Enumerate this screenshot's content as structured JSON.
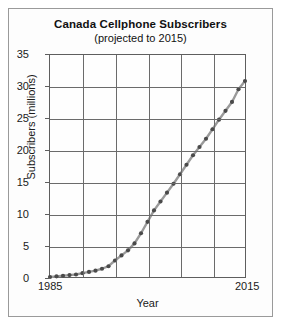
{
  "chart": {
    "title": "Canada Cellphone Subscribers",
    "subtitle": "(projected to 2015)"
  },
  "axis": {
    "x_title": "Year",
    "y_title": "Subscribers (millions)",
    "x_tick_labels": [
      "1985",
      "2015"
    ],
    "y_tick_labels": [
      "35",
      "30",
      "25",
      "20",
      "15",
      "10",
      "5",
      "0"
    ]
  },
  "style": {
    "line_color": "#9a9a9a",
    "marker_color": "#4a4a4a",
    "grid_color": "#6b6b6b",
    "axis_color": "#5e5e5e",
    "text_color": "#1a1a1a",
    "frame_color": "#9a9a9a",
    "background": "#fdfdfd"
  },
  "chart_data": {
    "type": "line",
    "title": "Canada Cellphone Subscribers (projected to 2015)",
    "xlabel": "Year",
    "ylabel": "Subscribers (millions)",
    "xlim": [
      1985,
      2015
    ],
    "ylim": [
      0,
      35
    ],
    "xticks": [
      1985,
      1990,
      1995,
      2000,
      2005,
      2010,
      2015
    ],
    "yticks": [
      0,
      5,
      10,
      15,
      20,
      25,
      30,
      35
    ],
    "grid": true,
    "legend": "none",
    "markers": "filled-circle",
    "x": [
      1985,
      1986,
      1987,
      1988,
      1989,
      1990,
      1991,
      1992,
      1993,
      1994,
      1995,
      1996,
      1997,
      1998,
      1999,
      2000,
      2001,
      2002,
      2003,
      2004,
      2005,
      2006,
      2007,
      2008,
      2009,
      2010,
      2011,
      2012,
      2013,
      2014,
      2015
    ],
    "values": [
      0.0,
      0.1,
      0.2,
      0.3,
      0.4,
      0.6,
      0.8,
      1.0,
      1.3,
      1.7,
      2.6,
      3.4,
      4.2,
      5.3,
      6.9,
      8.7,
      10.5,
      11.9,
      13.3,
      14.7,
      16.2,
      17.7,
      19.2,
      20.5,
      21.8,
      23.3,
      24.8,
      26.2,
      27.6,
      29.6,
      30.9
    ],
    "ylabel_units": "millions"
  }
}
